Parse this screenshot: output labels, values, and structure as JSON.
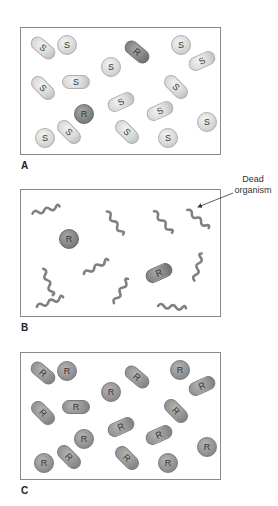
{
  "figure": {
    "panels": [
      {
        "label": "A",
        "description": "Mixed population: mostly S (sensitive) organisms with two R (resistant) organisms",
        "organisms": [
          {
            "type": "S",
            "shape": "rod",
            "x": 43,
            "y": 48,
            "angle": 40
          },
          {
            "type": "S",
            "shape": "sphere",
            "x": 67,
            "y": 45
          },
          {
            "type": "R",
            "shape": "rod",
            "x": 137,
            "y": 52,
            "angle": 40
          },
          {
            "type": "S",
            "shape": "sphere",
            "x": 181,
            "y": 45
          },
          {
            "type": "S",
            "shape": "rod",
            "x": 202,
            "y": 61,
            "angle": -25
          },
          {
            "type": "S",
            "shape": "sphere",
            "x": 111,
            "y": 67
          },
          {
            "type": "S",
            "shape": "rod",
            "x": 43,
            "y": 88,
            "angle": 45
          },
          {
            "type": "S",
            "shape": "rod",
            "x": 76,
            "y": 82,
            "angle": 0
          },
          {
            "type": "S",
            "shape": "rod",
            "x": 176,
            "y": 87,
            "angle": 45
          },
          {
            "type": "S",
            "shape": "rod",
            "x": 121,
            "y": 102,
            "angle": -25
          },
          {
            "type": "R",
            "shape": "sphere",
            "x": 84,
            "y": 114
          },
          {
            "type": "S",
            "shape": "rod",
            "x": 160,
            "y": 111,
            "angle": -25
          },
          {
            "type": "S",
            "shape": "sphere",
            "x": 207,
            "y": 122
          },
          {
            "type": "S",
            "shape": "sphere",
            "x": 45,
            "y": 138
          },
          {
            "type": "S",
            "shape": "rod",
            "x": 69,
            "y": 132,
            "angle": 45
          },
          {
            "type": "S",
            "shape": "rod",
            "x": 127,
            "y": 132,
            "angle": 45
          },
          {
            "type": "S",
            "shape": "sphere",
            "x": 168,
            "y": 138
          }
        ]
      },
      {
        "label": "B",
        "description": "After treatment: S organisms dead (wavy shapes), R organisms survive",
        "callout": {
          "line1": "Dead",
          "line2": "organism"
        },
        "organisms": [
          {
            "type": "R",
            "shape": "sphere",
            "x": 69,
            "y": 239
          },
          {
            "type": "R",
            "shape": "rod",
            "x": 159,
            "y": 273,
            "angle": -25
          }
        ],
        "dead": [
          {
            "x": 46,
            "y": 210,
            "angle": -15
          },
          {
            "x": 115,
            "y": 223,
            "angle": 55
          },
          {
            "x": 163,
            "y": 222,
            "angle": 50
          },
          {
            "x": 198,
            "y": 219,
            "angle": 40
          },
          {
            "x": 48,
            "y": 282,
            "angle": 70
          },
          {
            "x": 96,
            "y": 267,
            "angle": -30
          },
          {
            "x": 198,
            "y": 267,
            "angle": -75
          },
          {
            "x": 121,
            "y": 291,
            "angle": -60
          },
          {
            "x": 50,
            "y": 302,
            "angle": -20
          },
          {
            "x": 172,
            "y": 307,
            "angle": 5
          }
        ]
      },
      {
        "label": "C",
        "description": "Regrown population: all R (resistant) organisms",
        "organisms": [
          {
            "type": "R",
            "shape": "rod",
            "x": 43,
            "y": 373,
            "angle": 40
          },
          {
            "type": "R",
            "shape": "sphere",
            "x": 67,
            "y": 371
          },
          {
            "type": "R",
            "shape": "rod",
            "x": 137,
            "y": 377,
            "angle": 40
          },
          {
            "type": "R",
            "shape": "sphere",
            "x": 180,
            "y": 370
          },
          {
            "type": "R",
            "shape": "rod",
            "x": 202,
            "y": 386,
            "angle": -25
          },
          {
            "type": "R",
            "shape": "sphere",
            "x": 111,
            "y": 392
          },
          {
            "type": "R",
            "shape": "rod",
            "x": 43,
            "y": 413,
            "angle": 45
          },
          {
            "type": "R",
            "shape": "rod",
            "x": 76,
            "y": 407,
            "angle": 0
          },
          {
            "type": "R",
            "shape": "rod",
            "x": 176,
            "y": 411,
            "angle": 45
          },
          {
            "type": "R",
            "shape": "rod",
            "x": 121,
            "y": 427,
            "angle": -25
          },
          {
            "type": "R",
            "shape": "sphere",
            "x": 84,
            "y": 439
          },
          {
            "type": "R",
            "shape": "rod",
            "x": 159,
            "y": 435,
            "angle": -25
          },
          {
            "type": "R",
            "shape": "sphere",
            "x": 207,
            "y": 447
          },
          {
            "type": "R",
            "shape": "sphere",
            "x": 44,
            "y": 463
          },
          {
            "type": "R",
            "shape": "rod",
            "x": 69,
            "y": 457,
            "angle": 45
          },
          {
            "type": "R",
            "shape": "rod",
            "x": 127,
            "y": 458,
            "angle": 45
          },
          {
            "type": "R",
            "shape": "sphere",
            "x": 168,
            "y": 463
          }
        ]
      }
    ]
  },
  "colors": {
    "border": "#8a8a8a",
    "sensitive": "#d6d6d6",
    "resistant_dark": "#7e7e7e",
    "resistant_mid": "#8f8f8f",
    "dead": "#808080"
  }
}
